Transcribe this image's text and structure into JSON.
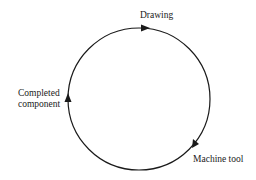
{
  "diagram": {
    "type": "cycle",
    "direction": "clockwise",
    "nodes": [
      {
        "id": "drawing",
        "label": "Drawing"
      },
      {
        "id": "machine_tool",
        "label": "Machine tool"
      },
      {
        "id": "completed_component",
        "label_line1": "Completed",
        "label_line2": "component"
      }
    ],
    "edges": [
      {
        "from": "drawing",
        "to": "machine_tool"
      },
      {
        "from": "machine_tool",
        "to": "completed_component"
      },
      {
        "from": "completed_component",
        "to": "drawing"
      }
    ],
    "stroke_color": "#1a1a1a"
  }
}
